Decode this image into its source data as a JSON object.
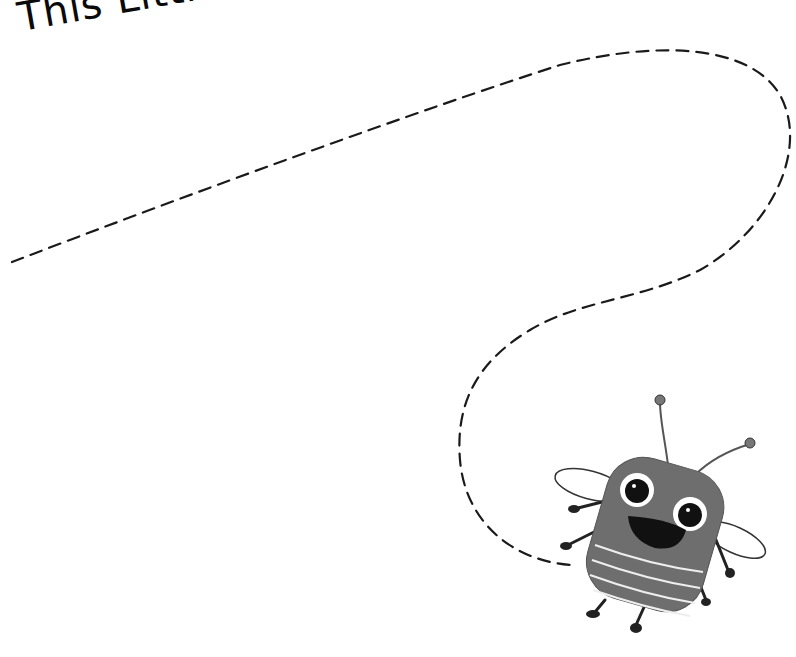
{
  "title": "This Little Tiger",
  "illustration": {
    "subject": "bee-icon",
    "style": "grayscale"
  },
  "trace_path": {
    "style": "dashed",
    "color": "#1a1a1a"
  },
  "colors": {
    "background": "#ffffff",
    "bee_body": "#6e6e6e",
    "ink": "#111111"
  }
}
